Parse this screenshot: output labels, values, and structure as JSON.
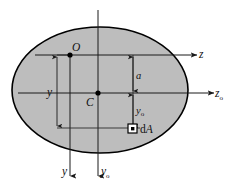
{
  "figure": {
    "type": "engineering-diagram",
    "background_color": "#ffffff",
    "shape": {
      "name": "ellipse-cross-section",
      "fill_color": "#bdbdbd",
      "stroke_color": "#000000",
      "center_x": 100,
      "center_y": 90,
      "radius_x": 88,
      "radius_y": 63
    },
    "points": [
      {
        "id": "O",
        "label": "O",
        "x": 70,
        "y": 55,
        "description": "reference origin point on upper axis"
      },
      {
        "id": "C",
        "label": "C",
        "x": 98,
        "y": 93,
        "description": "centroid of the area"
      }
    ],
    "axes": [
      {
        "id": "z-axis",
        "label": "z",
        "orientation": "horizontal",
        "direction": "right",
        "label_x": 201,
        "label_y": 56
      },
      {
        "id": "zo-axis",
        "label": "z",
        "subscript": "o",
        "orientation": "horizontal",
        "direction": "right",
        "label_x": 218,
        "label_y": 95
      },
      {
        "id": "y-axis",
        "label": "y",
        "orientation": "vertical",
        "direction": "down",
        "label_x": 64,
        "label_y": 173
      },
      {
        "id": "yo-axis",
        "label": "y",
        "subscript": "o",
        "orientation": "vertical",
        "direction": "down",
        "label_x": 103,
        "label_y": 173
      }
    ],
    "dimensions": [
      {
        "id": "dim-y",
        "label": "y",
        "orientation": "vertical",
        "label_x": 51,
        "label_y": 95,
        "from_y": 55,
        "to_y": 128,
        "at_x": 57
      },
      {
        "id": "dim-a",
        "label": "a",
        "orientation": "vertical",
        "label_x": 138,
        "label_y": 77,
        "from_y": 55,
        "to_y": 93,
        "at_x": 133
      },
      {
        "id": "dim-yo",
        "label": "y",
        "subscript": "o",
        "orientation": "vertical",
        "label_x": 138,
        "label_y": 112,
        "from_y": 93,
        "to_y": 128,
        "at_x": 133
      }
    ],
    "elements": [
      {
        "id": "dA",
        "label": "d",
        "italic_part": "A",
        "description": "differential area element",
        "square_x": 132,
        "square_y": 128,
        "label_x": 141,
        "label_y": 132
      }
    ]
  }
}
